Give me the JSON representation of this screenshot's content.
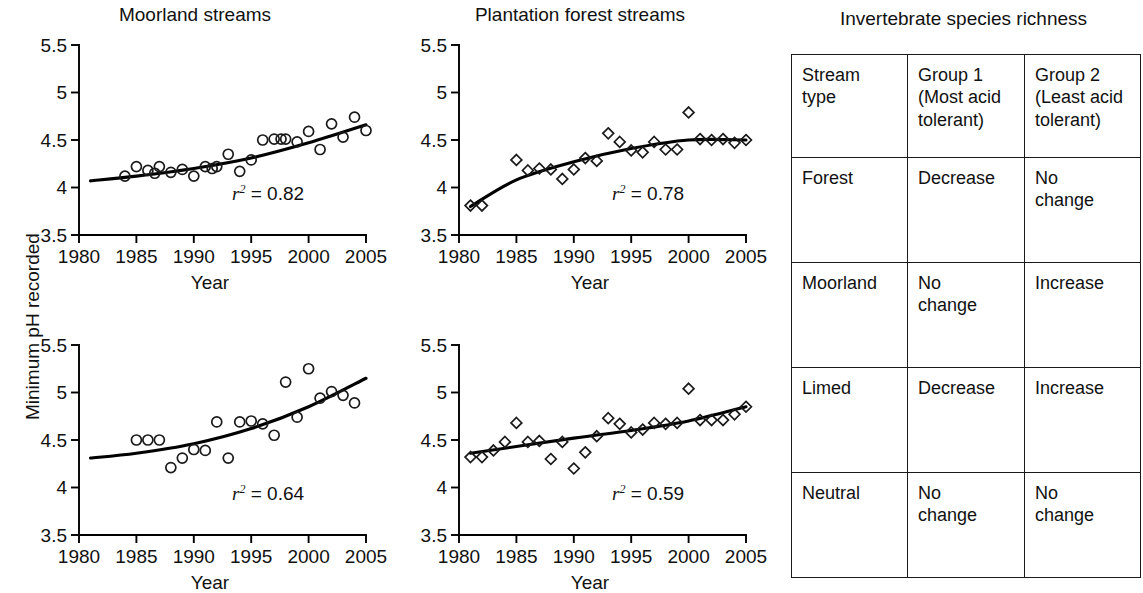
{
  "figure": {
    "y_axis_label": "Minimum pH recorded",
    "x_axis_label": "Year",
    "y_ticks": [
      "3.5",
      "4",
      "4.5",
      "5",
      "5.5"
    ],
    "x_ticks": [
      "1980",
      "1985",
      "1990",
      "1995",
      "2000",
      "2005"
    ]
  },
  "chart_data": [
    {
      "type": "scatter",
      "panel": "top-left",
      "title": "Moorland streams",
      "xlabel": "Year",
      "ylabel": "Minimum pH recorded",
      "xlim": [
        1980,
        2005
      ],
      "ylim": [
        3.5,
        5.5
      ],
      "xticks": [
        1980,
        1985,
        1990,
        1995,
        2000,
        2005
      ],
      "yticks": [
        3.5,
        4,
        4.5,
        5,
        5.5
      ],
      "marker": "open-circle",
      "grid": false,
      "annotation": "r2 = 0.82",
      "r_squared": 0.82,
      "points": [
        {
          "x": 1984,
          "y": 4.12
        },
        {
          "x": 1985,
          "y": 4.22
        },
        {
          "x": 1986,
          "y": 4.18
        },
        {
          "x": 1986.6,
          "y": 4.15
        },
        {
          "x": 1987,
          "y": 4.22
        },
        {
          "x": 1988,
          "y": 4.16
        },
        {
          "x": 1989,
          "y": 4.19
        },
        {
          "x": 1990,
          "y": 4.12
        },
        {
          "x": 1991,
          "y": 4.22
        },
        {
          "x": 1991.6,
          "y": 4.2
        },
        {
          "x": 1992,
          "y": 4.22
        },
        {
          "x": 1993,
          "y": 4.35
        },
        {
          "x": 1994,
          "y": 4.17
        },
        {
          "x": 1995,
          "y": 4.29
        },
        {
          "x": 1996,
          "y": 4.5
        },
        {
          "x": 1997,
          "y": 4.51
        },
        {
          "x": 1997.6,
          "y": 4.51
        },
        {
          "x": 1998,
          "y": 4.51
        },
        {
          "x": 1999,
          "y": 4.48
        },
        {
          "x": 2000,
          "y": 4.59
        },
        {
          "x": 2001,
          "y": 4.4
        },
        {
          "x": 2002,
          "y": 4.67
        },
        {
          "x": 2003,
          "y": 4.53
        },
        {
          "x": 2004,
          "y": 4.74
        },
        {
          "x": 2005,
          "y": 4.6
        }
      ],
      "trend": [
        {
          "x": 1981,
          "y": 4.07
        },
        {
          "x": 1985,
          "y": 4.12
        },
        {
          "x": 1990,
          "y": 4.2
        },
        {
          "x": 1995,
          "y": 4.31
        },
        {
          "x": 2000,
          "y": 4.47
        },
        {
          "x": 2005,
          "y": 4.66
        }
      ]
    },
    {
      "type": "scatter",
      "panel": "top-right",
      "title": "Plantation forest streams",
      "xlabel": "Year",
      "ylabel": "Minimum pH recorded",
      "xlim": [
        1980,
        2005
      ],
      "ylim": [
        3.5,
        5.5
      ],
      "xticks": [
        1980,
        1985,
        1990,
        1995,
        2000,
        2005
      ],
      "yticks": [
        3.5,
        4,
        4.5,
        5,
        5.5
      ],
      "marker": "open-diamond",
      "grid": false,
      "annotation": "r2 = 0.78",
      "r_squared": 0.78,
      "points": [
        {
          "x": 1981,
          "y": 3.81
        },
        {
          "x": 1982,
          "y": 3.81
        },
        {
          "x": 1985,
          "y": 4.29
        },
        {
          "x": 1986,
          "y": 4.18
        },
        {
          "x": 1987,
          "y": 4.2
        },
        {
          "x": 1988,
          "y": 4.19
        },
        {
          "x": 1989,
          "y": 4.09
        },
        {
          "x": 1990,
          "y": 4.19
        },
        {
          "x": 1991,
          "y": 4.31
        },
        {
          "x": 1992,
          "y": 4.28
        },
        {
          "x": 1993,
          "y": 4.57
        },
        {
          "x": 1994,
          "y": 4.48
        },
        {
          "x": 1995,
          "y": 4.39
        },
        {
          "x": 1996,
          "y": 4.37
        },
        {
          "x": 1997,
          "y": 4.48
        },
        {
          "x": 1998,
          "y": 4.4
        },
        {
          "x": 1999,
          "y": 4.4
        },
        {
          "x": 2000,
          "y": 4.79
        },
        {
          "x": 2001,
          "y": 4.51
        },
        {
          "x": 2002,
          "y": 4.5
        },
        {
          "x": 2003,
          "y": 4.51
        },
        {
          "x": 2004,
          "y": 4.47
        },
        {
          "x": 2005,
          "y": 4.5
        }
      ],
      "trend": [
        {
          "x": 1981,
          "y": 3.8
        },
        {
          "x": 1985,
          "y": 4.08
        },
        {
          "x": 1990,
          "y": 4.27
        },
        {
          "x": 1995,
          "y": 4.41
        },
        {
          "x": 2000,
          "y": 4.5
        },
        {
          "x": 2005,
          "y": 4.5
        }
      ]
    },
    {
      "type": "scatter",
      "panel": "bottom-left",
      "title": "",
      "xlabel": "Year",
      "ylabel": "Minimum pH recorded",
      "xlim": [
        1980,
        2005
      ],
      "ylim": [
        3.5,
        5.5
      ],
      "xticks": [
        1980,
        1985,
        1990,
        1995,
        2000,
        2005
      ],
      "yticks": [
        3.5,
        4,
        4.5,
        5,
        5.5
      ],
      "marker": "open-circle",
      "grid": false,
      "annotation": "r2 = 0.64",
      "r_squared": 0.64,
      "points": [
        {
          "x": 1985,
          "y": 4.5
        },
        {
          "x": 1986,
          "y": 4.5
        },
        {
          "x": 1987,
          "y": 4.5
        },
        {
          "x": 1988,
          "y": 4.21
        },
        {
          "x": 1989,
          "y": 4.31
        },
        {
          "x": 1990,
          "y": 4.4
        },
        {
          "x": 1991,
          "y": 4.39
        },
        {
          "x": 1992,
          "y": 4.69
        },
        {
          "x": 1993,
          "y": 4.31
        },
        {
          "x": 1994,
          "y": 4.69
        },
        {
          "x": 1995,
          "y": 4.7
        },
        {
          "x": 1996,
          "y": 4.67
        },
        {
          "x": 1997,
          "y": 4.55
        },
        {
          "x": 1998,
          "y": 5.11
        },
        {
          "x": 1999,
          "y": 4.74
        },
        {
          "x": 2000,
          "y": 5.25
        },
        {
          "x": 2001,
          "y": 4.94
        },
        {
          "x": 2002,
          "y": 5.01
        },
        {
          "x": 2003,
          "y": 4.97
        },
        {
          "x": 2004,
          "y": 4.89
        }
      ],
      "trend": [
        {
          "x": 1981,
          "y": 4.31
        },
        {
          "x": 1985,
          "y": 4.36
        },
        {
          "x": 1990,
          "y": 4.46
        },
        {
          "x": 1995,
          "y": 4.62
        },
        {
          "x": 2000,
          "y": 4.85
        },
        {
          "x": 2005,
          "y": 5.15
        }
      ]
    },
    {
      "type": "scatter",
      "panel": "bottom-right",
      "title": "",
      "xlabel": "Year",
      "ylabel": "Minimum pH recorded",
      "xlim": [
        1980,
        2005
      ],
      "ylim": [
        3.5,
        5.5
      ],
      "xticks": [
        1980,
        1985,
        1990,
        1995,
        2000,
        2005
      ],
      "yticks": [
        3.5,
        4,
        4.5,
        5,
        5.5
      ],
      "marker": "open-diamond",
      "grid": false,
      "annotation": "r2 = 0.59",
      "r_squared": 0.59,
      "points": [
        {
          "x": 1981,
          "y": 4.32
        },
        {
          "x": 1982,
          "y": 4.32
        },
        {
          "x": 1983,
          "y": 4.39
        },
        {
          "x": 1984,
          "y": 4.48
        },
        {
          "x": 1985,
          "y": 4.68
        },
        {
          "x": 1986,
          "y": 4.48
        },
        {
          "x": 1987,
          "y": 4.49
        },
        {
          "x": 1988,
          "y": 4.3
        },
        {
          "x": 1989,
          "y": 4.48
        },
        {
          "x": 1990,
          "y": 4.2
        },
        {
          "x": 1991,
          "y": 4.37
        },
        {
          "x": 1992,
          "y": 4.54
        },
        {
          "x": 1993,
          "y": 4.73
        },
        {
          "x": 1994,
          "y": 4.67
        },
        {
          "x": 1995,
          "y": 4.58
        },
        {
          "x": 1996,
          "y": 4.61
        },
        {
          "x": 1997,
          "y": 4.68
        },
        {
          "x": 1998,
          "y": 4.67
        },
        {
          "x": 1999,
          "y": 4.68
        },
        {
          "x": 2000,
          "y": 5.04
        },
        {
          "x": 2001,
          "y": 4.71
        },
        {
          "x": 2002,
          "y": 4.71
        },
        {
          "x": 2003,
          "y": 4.71
        },
        {
          "x": 2004,
          "y": 4.77
        },
        {
          "x": 2005,
          "y": 4.85
        }
      ],
      "trend": [
        {
          "x": 1981,
          "y": 4.36
        },
        {
          "x": 1990,
          "y": 4.52
        },
        {
          "x": 1995,
          "y": 4.6
        },
        {
          "x": 2000,
          "y": 4.7
        },
        {
          "x": 2005,
          "y": 4.85
        }
      ]
    }
  ],
  "table": {
    "title": "Invertebrate species richness",
    "headers": [
      "Stream\ntype",
      "Group 1\n(Most acid\ntolerant)",
      "Group 2\n(Least acid\ntolerant)"
    ],
    "rows": [
      [
        "Forest",
        "Decrease",
        "No\nchange"
      ],
      [
        "Moorland",
        "No\nchange",
        "Increase"
      ],
      [
        "Limed",
        "Decrease",
        "Increase"
      ],
      [
        "Neutral",
        "No\nchange",
        "No\nchange"
      ]
    ]
  }
}
